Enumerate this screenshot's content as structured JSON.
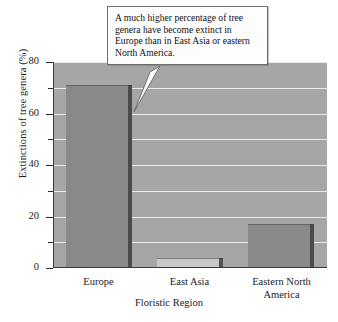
{
  "chart_data": {
    "type": "bar",
    "title": "",
    "subtitle": "",
    "xlabel": "Floristic Region",
    "ylabel": "Extinctions of tree genera (%)",
    "categories": [
      "Europe",
      "East Asia",
      "Eastern North America"
    ],
    "values": [
      71,
      4,
      17
    ],
    "series": [
      {
        "name": "Extinctions of tree genera (%)",
        "values": [
          71,
          4,
          17
        ]
      }
    ],
    "ylim": [
      0,
      80
    ],
    "ymajor_ticks": [
      0,
      20,
      40,
      60,
      80
    ],
    "yminor_ticks": [
      10,
      30,
      50,
      70
    ],
    "ytick_labels": [
      "0",
      "20",
      "40",
      "60",
      "80"
    ],
    "grid": "horizontal",
    "legend": "none",
    "annotations": [
      {
        "name": "callout",
        "text": "A much higher percentage of tree genera have become extinct in Europe than in East Asia or eastern North America.",
        "points_to": "Europe"
      }
    ],
    "colors": {
      "plot_background": "#a6a6a6",
      "bar_dark": "#8a8a8a",
      "bar_light": "#c8c8c8",
      "gridline": "#eceaea",
      "axis": "#2b2b2b",
      "callout_background": "#fdfdfd",
      "callout_border": "#6d6d6d",
      "text": "#1a1a1a",
      "page_background": "#ffffff"
    },
    "bar_fill_keys": [
      "bar_dark",
      "bar_light",
      "bar_dark"
    ]
  },
  "axes": {
    "y_labels": [
      {
        "value": "80"
      },
      {
        "value": "60"
      },
      {
        "value": "40"
      },
      {
        "value": "20"
      },
      {
        "value": "0"
      }
    ],
    "x_labels": [
      {
        "line1": "Europe",
        "line2": ""
      },
      {
        "line1": "East Asia",
        "line2": ""
      },
      {
        "line1": "Eastern North",
        "line2": "America"
      }
    ]
  }
}
